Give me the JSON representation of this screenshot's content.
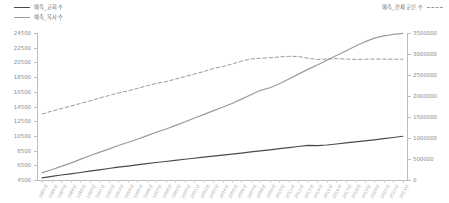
{
  "chart_data": {
    "type": "line",
    "title": "",
    "xlabel": "",
    "ylabel_left": "",
    "ylabel_right": "",
    "grid": false,
    "legend_position": "top",
    "ylim_left": [
      4500,
      24500
    ],
    "ylim_right": [
      0,
      3500000
    ],
    "yticks_left": [
      24500,
      22500,
      20500,
      18500,
      16500,
      14500,
      12500,
      10500,
      8500,
      6500,
      4500
    ],
    "yticks_right": [
      3500000,
      3000000,
      2500000,
      2000000,
      1500000,
      1000000,
      500000,
      0
    ],
    "categories": [
      "1985년",
      "1986년",
      "1987년",
      "1988년",
      "1989년",
      "1990년",
      "1991년",
      "1992년",
      "1993년",
      "1994년",
      "1995년",
      "1996년",
      "1997년",
      "1998년",
      "1999년",
      "2000년",
      "2001년",
      "2002년",
      "2003년",
      "2004년",
      "2005년",
      "2006년",
      "2007년",
      "2008년",
      "2009년",
      "2010년",
      "2011년",
      "2012년",
      "2013년",
      "2014년",
      "2015년",
      "2016년",
      "2017년",
      "2018년",
      "2019년",
      "2020년",
      "2021년",
      "2022년",
      "2023년"
    ],
    "series": [
      {
        "name": "예측_교회 수",
        "axis": "left",
        "style": "solid",
        "color": "#4a4a4a",
        "values": [
          4800,
          5000,
          5180,
          5340,
          5520,
          5700,
          5880,
          6060,
          6240,
          6400,
          6560,
          6720,
          6880,
          7020,
          7160,
          7320,
          7460,
          7600,
          7750,
          7880,
          8020,
          8160,
          8320,
          8460,
          8600,
          8760,
          8900,
          9060,
          9200,
          9180,
          9260,
          9400,
          9540,
          9680,
          9820,
          9960,
          10120,
          10280,
          10450
        ]
      },
      {
        "name": "예측_목사 수",
        "axis": "left",
        "style": "solid",
        "color": "#9a9a9a",
        "values": [
          5500,
          5900,
          6350,
          6800,
          7300,
          7800,
          8250,
          8700,
          9200,
          9600,
          10050,
          10500,
          11000,
          11400,
          11900,
          12400,
          12900,
          13400,
          13900,
          14400,
          14900,
          15500,
          16100,
          16700,
          17050,
          17600,
          18250,
          18900,
          19550,
          20150,
          20800,
          21450,
          22050,
          22700,
          23300,
          23800,
          24100,
          24300,
          24450
        ]
      },
      {
        "name": "예측_전체 교인 수",
        "axis": "right",
        "style": "dashed",
        "color": "#9a9a9a",
        "values": [
          1570000,
          1640000,
          1700000,
          1760000,
          1820000,
          1880000,
          1950000,
          2010000,
          2070000,
          2120000,
          2180000,
          2240000,
          2300000,
          2340000,
          2400000,
          2460000,
          2520000,
          2580000,
          2650000,
          2700000,
          2760000,
          2830000,
          2880000,
          2900000,
          2910000,
          2930000,
          2945000,
          2940000,
          2900000,
          2870000,
          2880000,
          2890000,
          2880000,
          2870000,
          2875000,
          2880000,
          2878000,
          2876000,
          2875000
        ]
      }
    ]
  },
  "legend": {
    "left_entries": [
      {
        "label": "예측_교회 수",
        "swatch": "solid-dark"
      },
      {
        "label": "예측_목사 수",
        "swatch": "solid-gray"
      }
    ],
    "right_entries": [
      {
        "label": "예측_전체 교인 수",
        "swatch": "dashed"
      }
    ]
  }
}
